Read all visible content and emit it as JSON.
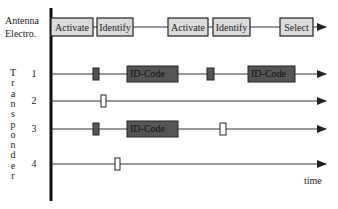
{
  "diagram": {
    "antenna_label": [
      "Antenna",
      "Electro."
    ],
    "vertical_label": "Transponder",
    "time_label": "time",
    "colors": {
      "antenna_box_fill": "#dcdcdc",
      "id_code_fill": "#555555",
      "dark_marker_fill": "#555555",
      "light_marker_fill": "#ffffff",
      "line": "#333333"
    },
    "antenna_boxes": [
      {
        "label": "Activate"
      },
      {
        "label": "Identify"
      },
      {
        "label": "Activate"
      },
      {
        "label": "Identify"
      },
      {
        "label": "Select"
      }
    ],
    "transponders": [
      {
        "label": "1",
        "events": [
          {
            "type": "dark-marker"
          },
          {
            "type": "id-code",
            "label": "ID-Code"
          },
          {
            "type": "dark-marker"
          },
          {
            "type": "id-code",
            "label": "ID-Code"
          }
        ]
      },
      {
        "label": "2",
        "events": [
          {
            "type": "light-marker"
          }
        ]
      },
      {
        "label": "3",
        "events": [
          {
            "type": "dark-marker"
          },
          {
            "type": "id-code",
            "label": "ID-Code"
          },
          {
            "type": "light-marker"
          }
        ]
      },
      {
        "label": "4",
        "events": [
          {
            "type": "light-marker"
          }
        ]
      }
    ]
  }
}
